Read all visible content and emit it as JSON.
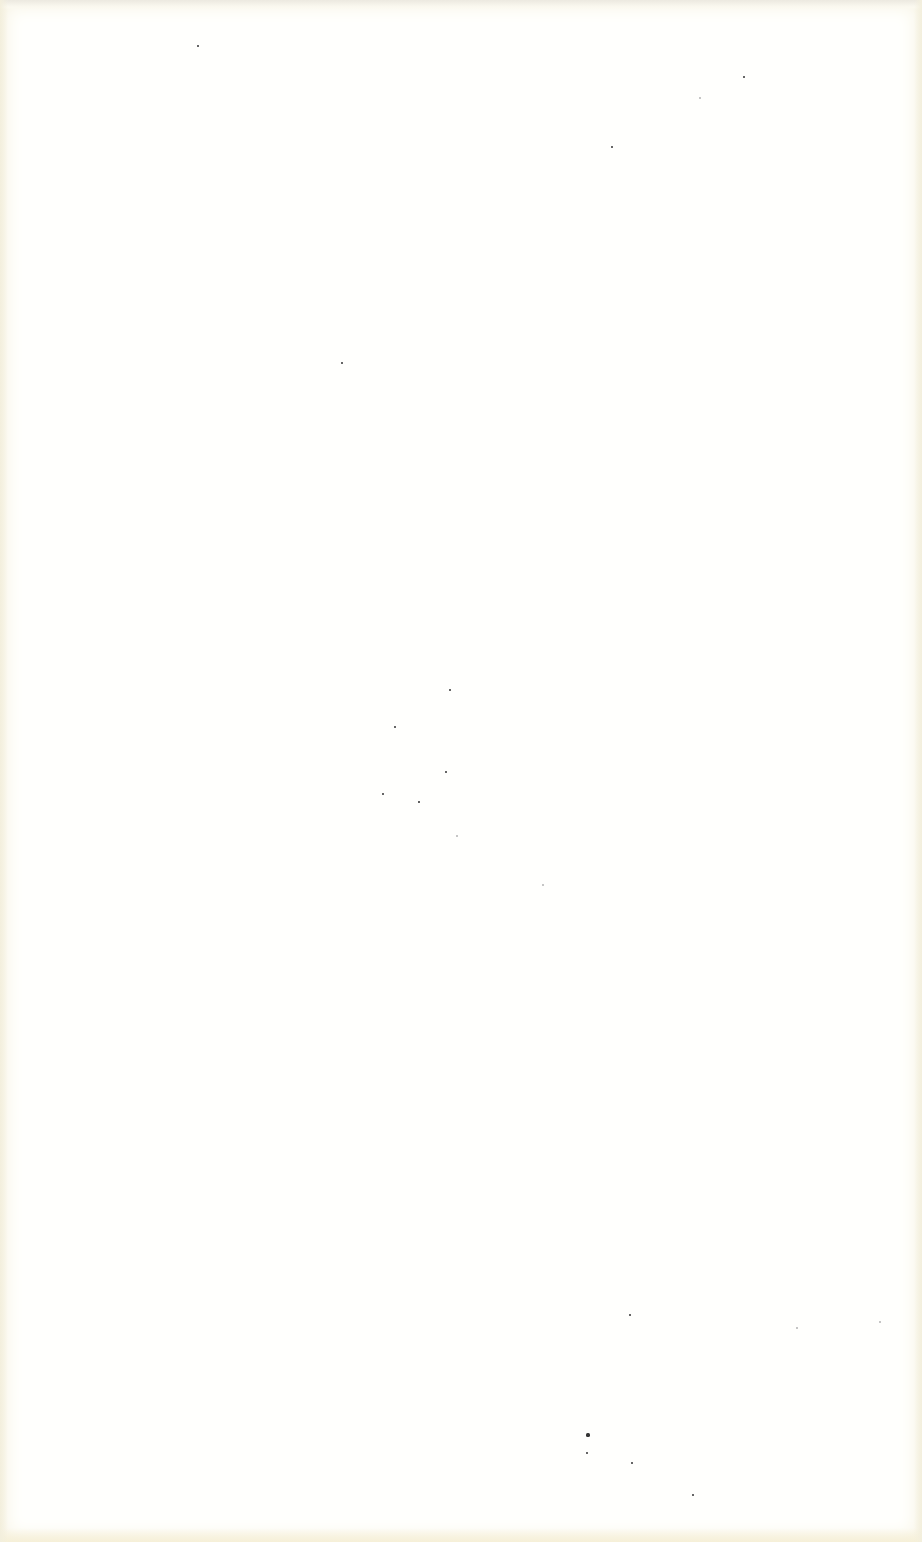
{
  "page": {
    "type": "blank scanned page",
    "text": "",
    "background_color": "#fffffd",
    "edge_tint_color": "#f3efdd"
  },
  "specks": [
    {
      "x": 198,
      "y": 46,
      "r": 1.2,
      "faint": false
    },
    {
      "x": 612,
      "y": 147,
      "r": 1.2,
      "faint": false
    },
    {
      "x": 744,
      "y": 77,
      "r": 1,
      "faint": false
    },
    {
      "x": 700,
      "y": 98,
      "r": 0.8,
      "faint": true
    },
    {
      "x": 342,
      "y": 363,
      "r": 1,
      "faint": false
    },
    {
      "x": 450,
      "y": 690,
      "r": 1,
      "faint": false
    },
    {
      "x": 395,
      "y": 727,
      "r": 1,
      "faint": false
    },
    {
      "x": 446,
      "y": 772,
      "r": 1,
      "faint": false
    },
    {
      "x": 383,
      "y": 794,
      "r": 1,
      "faint": false
    },
    {
      "x": 419,
      "y": 802,
      "r": 0.9,
      "faint": false
    },
    {
      "x": 457,
      "y": 836,
      "r": 0.8,
      "faint": true
    },
    {
      "x": 543,
      "y": 885,
      "r": 0.8,
      "faint": true
    },
    {
      "x": 630,
      "y": 1315,
      "r": 1,
      "faint": false
    },
    {
      "x": 588,
      "y": 1435,
      "r": 1.6,
      "faint": false
    },
    {
      "x": 587,
      "y": 1453,
      "r": 1.2,
      "faint": false
    },
    {
      "x": 632,
      "y": 1463,
      "r": 1.3,
      "faint": false
    },
    {
      "x": 693,
      "y": 1495,
      "r": 1.4,
      "faint": false
    },
    {
      "x": 880,
      "y": 1322,
      "r": 0.8,
      "faint": true
    },
    {
      "x": 797,
      "y": 1328,
      "r": 0.7,
      "faint": true
    }
  ]
}
